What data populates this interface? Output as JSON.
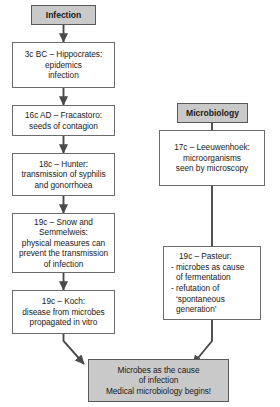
{
  "diagram": {
    "title_visible": false,
    "colors": {
      "box_fill": "#ffffff",
      "header_fill": "#c9c9c9",
      "result_fill": "#c9c9c9",
      "border": "#6b6b6b",
      "arrow": "#4a4a4a",
      "text": "#1a1a1a"
    },
    "left_column": {
      "header": {
        "label": "Infection"
      },
      "nodes": [
        {
          "name": "hippocrates",
          "lines": [
            "3c BC – Hippocrates:",
            "epidemics",
            "infection"
          ]
        },
        {
          "name": "fracastoro",
          "lines": [
            "16c AD – Fracastoro:",
            "seeds of contagion"
          ]
        },
        {
          "name": "hunter",
          "lines": [
            "18c – Hunter:",
            "transmission of syphilis",
            "and gonorrhoea"
          ]
        },
        {
          "name": "snow-semmelweis",
          "lines": [
            "19c – Snow and",
            "Semmelweis:",
            "physical measures can",
            "prevent the transmission",
            "of infection"
          ]
        },
        {
          "name": "koch",
          "lines": [
            "19c – Koch:",
            "disease from microbes",
            "propagated in vitro"
          ]
        }
      ]
    },
    "right_column": {
      "header": {
        "label": "Microbiology"
      },
      "nodes": [
        {
          "name": "leeuwenhoek",
          "lines": [
            "17c – Leeuwenhoek:",
            "microorganisms",
            "seen by microscopy"
          ]
        },
        {
          "name": "pasteur",
          "lines": [
            "19c – Pasteur:",
            "- microbes as cause",
            "of fermentation",
            "- refutation of",
            "‘spontaneous",
            "generation’"
          ]
        }
      ]
    },
    "conclusion": {
      "name": "conclusion",
      "lines": [
        "Microbes as the cause",
        "of infection",
        "Medical microbiology begins!"
      ]
    }
  }
}
